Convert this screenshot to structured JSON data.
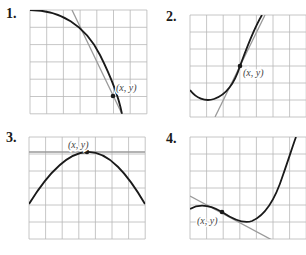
{
  "figure": {
    "panels": [
      {
        "number": "1.",
        "point_label": "(x, y)",
        "grid": {
          "x": 30,
          "y": 10,
          "cols": 7,
          "rows": 6,
          "cell_w": 16.7,
          "cell_h": 17.3
        },
        "curve_path": "M30,10 C60,10 85,25 100,55 C110,75 118,93 122,114",
        "tangent": {
          "x1": 72,
          "y1": 10,
          "x2": 122,
          "y2": 114
        },
        "point": {
          "cx": 113,
          "cy": 96
        },
        "label_pos": {
          "x": 116,
          "y": 91
        }
      },
      {
        "number": "2.",
        "point_label": "(x, y)",
        "grid": {
          "x": 190,
          "y": 15,
          "cols": 7,
          "rows": 6,
          "cell_w": 16.6,
          "cell_h": 17
        },
        "curve_path": "M190,90 C196,98 205,102 214,99 C226,95 235,82 240,66 C246,50 253,30 262,15",
        "tangent": {
          "x1": 215,
          "y1": 117,
          "x2": 265,
          "y2": 15
        },
        "point": {
          "cx": 240,
          "cy": 66
        },
        "label_pos": {
          "x": 243,
          "y": 76
        }
      },
      {
        "number": "3.",
        "point_label": "(x, y)",
        "grid": {
          "x": 29,
          "y": 137,
          "cols": 7,
          "rows": 6,
          "cell_w": 16.6,
          "cell_h": 17
        },
        "curve_path": "M29,204 C45,178 65,153 87,152 C109,151 128,175 145,204",
        "tangent": {
          "x1": 29,
          "y1": 152,
          "x2": 145,
          "y2": 152
        },
        "point": {
          "cx": 87,
          "cy": 152
        },
        "label_pos": {
          "x": 68,
          "y": 148
        }
      },
      {
        "number": "4.",
        "point_label": "(x, y)",
        "grid": {
          "x": 190,
          "y": 137,
          "cols": 7,
          "rows": 6,
          "cell_w": 16.6,
          "cell_h": 17
        },
        "curve_path": "M190,209 C200,203 210,205 222,212 C234,220 244,224 252,221 C264,216 275,200 283,175 C289,158 293,145 296,137",
        "tangent": {
          "x1": 190,
          "y1": 196,
          "x2": 272,
          "y2": 240
        },
        "point": {
          "cx": 222,
          "cy": 212
        },
        "label_pos": {
          "x": 197,
          "y": 224
        }
      }
    ],
    "colors": {
      "grid": "#b8b8b8",
      "curve": "#1a1a1a",
      "tangent": "#9a9a9a",
      "label": "#444444"
    }
  }
}
